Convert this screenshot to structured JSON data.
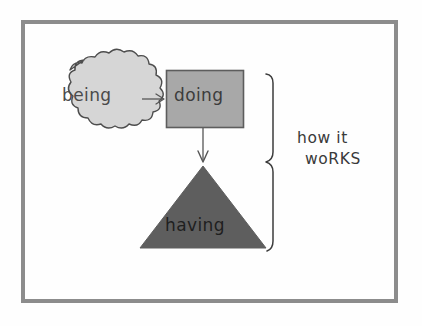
{
  "diagram": {
    "title_text": "how it works",
    "background_color": "#fefefe",
    "frame": {
      "name": "outer-frame",
      "color": "#8c8c8c"
    },
    "nodes": [
      {
        "id": "being",
        "label": "being",
        "shape": "cloud",
        "fill": "#d5d5d5",
        "stroke": "#4a4a4a"
      },
      {
        "id": "doing",
        "label": "doing",
        "shape": "rectangle",
        "fill": "#a8a8a8",
        "stroke": "#5a5a5a"
      },
      {
        "id": "having",
        "label": "having",
        "shape": "triangle",
        "fill": "#5e5e5e",
        "stroke": "#5e5e5e"
      }
    ],
    "connectors": [
      {
        "id": "being-to-doing",
        "from": "being",
        "to": "doing",
        "direction": "right",
        "stroke": "#555555"
      },
      {
        "id": "doing-to-having",
        "from": "doing",
        "to": "having",
        "direction": "down",
        "stroke": "#555555"
      }
    ],
    "brace": {
      "id": "grouping-brace",
      "orientation": "right",
      "stroke": "#3a3a3a",
      "covers": [
        "doing",
        "having"
      ]
    },
    "annotation": {
      "line1": "how it",
      "line2": "woRKS"
    }
  }
}
